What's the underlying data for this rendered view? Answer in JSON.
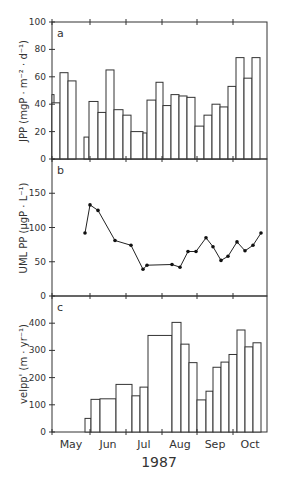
{
  "chart_data": [
    {
      "type": "bar",
      "panel": "a",
      "ylabel": "JPP (mgP · m−2 · d−1)",
      "ylim": [
        0,
        100
      ],
      "yticks": [
        0,
        20,
        40,
        60,
        80,
        100
      ],
      "bars": [
        {
          "x0": 52,
          "x1": 54,
          "value": 47
        },
        {
          "x0": 52,
          "x1": 60,
          "value": 41
        },
        {
          "x0": 60,
          "x1": 68,
          "value": 63
        },
        {
          "x0": 68,
          "x1": 76,
          "value": 57
        },
        {
          "x0": 84,
          "x1": 89,
          "value": 16
        },
        {
          "x0": 89,
          "x1": 98,
          "value": 42
        },
        {
          "x0": 98,
          "x1": 106,
          "value": 34
        },
        {
          "x0": 106,
          "x1": 114,
          "value": 65
        },
        {
          "x0": 114,
          "x1": 123,
          "value": 36
        },
        {
          "x0": 123,
          "x1": 131,
          "value": 32
        },
        {
          "x0": 131,
          "x1": 143,
          "value": 20
        },
        {
          "x0": 143,
          "x1": 147,
          "value": 19
        },
        {
          "x0": 147,
          "x1": 156,
          "value": 43
        },
        {
          "x0": 156,
          "x1": 163,
          "value": 56
        },
        {
          "x0": 163,
          "x1": 171,
          "value": 39
        },
        {
          "x0": 171,
          "x1": 179,
          "value": 47
        },
        {
          "x0": 179,
          "x1": 187,
          "value": 46
        },
        {
          "x0": 187,
          "x1": 195,
          "value": 45
        },
        {
          "x0": 195,
          "x1": 204,
          "value": 24
        },
        {
          "x0": 204,
          "x1": 212,
          "value": 32
        },
        {
          "x0": 212,
          "x1": 220,
          "value": 40
        },
        {
          "x0": 220,
          "x1": 228,
          "value": 38
        },
        {
          "x0": 228,
          "x1": 236,
          "value": 53
        },
        {
          "x0": 236,
          "x1": 244,
          "value": 74
        },
        {
          "x0": 244,
          "x1": 252,
          "value": 59
        },
        {
          "x0": 252,
          "x1": 260,
          "value": 74
        }
      ]
    },
    {
      "type": "line",
      "panel": "b",
      "ylabel": "UML PP (μgP · L−1)",
      "ylim": [
        0,
        200
      ],
      "yticks": [
        0,
        50,
        100,
        150
      ],
      "points": [
        {
          "x": 85,
          "y": 92
        },
        {
          "x": 90,
          "y": 133
        },
        {
          "x": 98,
          "y": 125
        },
        {
          "x": 115,
          "y": 81
        },
        {
          "x": 131,
          "y": 74
        },
        {
          "x": 143,
          "y": 39
        },
        {
          "x": 147,
          "y": 45
        },
        {
          "x": 172,
          "y": 46
        },
        {
          "x": 180,
          "y": 42
        },
        {
          "x": 188,
          "y": 65
        },
        {
          "x": 196,
          "y": 65
        },
        {
          "x": 206,
          "y": 85
        },
        {
          "x": 213,
          "y": 72
        },
        {
          "x": 221,
          "y": 52
        },
        {
          "x": 228,
          "y": 58
        },
        {
          "x": 237,
          "y": 79
        },
        {
          "x": 245,
          "y": 66
        },
        {
          "x": 253,
          "y": 74
        },
        {
          "x": 261,
          "y": 92
        }
      ]
    },
    {
      "type": "bar",
      "panel": "c",
      "ylabel": "velPP' (m · yr−1)",
      "ylim": [
        0,
        500
      ],
      "yticks": [
        0,
        100,
        200,
        300,
        400
      ],
      "bars": [
        {
          "x0": 85,
          "x1": 91,
          "value": 50
        },
        {
          "x0": 91,
          "x1": 100,
          "value": 120
        },
        {
          "x0": 100,
          "x1": 116,
          "value": 122
        },
        {
          "x0": 116,
          "x1": 132,
          "value": 175
        },
        {
          "x0": 132,
          "x1": 140,
          "value": 133
        },
        {
          "x0": 140,
          "x1": 148,
          "value": 165
        },
        {
          "x0": 148,
          "x1": 172,
          "value": 355
        },
        {
          "x0": 172,
          "x1": 181,
          "value": 403
        },
        {
          "x0": 181,
          "x1": 189,
          "value": 323
        },
        {
          "x0": 189,
          "x1": 197,
          "value": 255
        },
        {
          "x0": 197,
          "x1": 206,
          "value": 118
        },
        {
          "x0": 206,
          "x1": 213,
          "value": 150
        },
        {
          "x0": 213,
          "x1": 221,
          "value": 238
        },
        {
          "x0": 221,
          "x1": 229,
          "value": 257
        },
        {
          "x0": 229,
          "x1": 237,
          "value": 285
        },
        {
          "x0": 237,
          "x1": 245,
          "value": 375
        },
        {
          "x0": 245,
          "x1": 253,
          "value": 313
        },
        {
          "x0": 253,
          "x1": 261,
          "value": 328
        }
      ]
    }
  ],
  "panels": {
    "a": "a",
    "b": "b",
    "c": "c"
  },
  "ylabels": {
    "a": "JPP  (mgP · m⁻² · d⁻¹)",
    "b": "UML PP (μgP · L⁻¹)",
    "c": "velpp' (m · yr⁻¹)"
  },
  "yticks": {
    "a": [
      "0",
      "20",
      "40",
      "60",
      "80",
      "100"
    ],
    "b": [
      "0",
      "50",
      "100",
      "150"
    ],
    "c": [
      "0",
      "100",
      "200",
      "300",
      "400"
    ]
  },
  "xaxis": {
    "months": [
      "May",
      "Jun",
      "Jul",
      "Aug",
      "Sep",
      "Oct"
    ],
    "year": "1987"
  }
}
